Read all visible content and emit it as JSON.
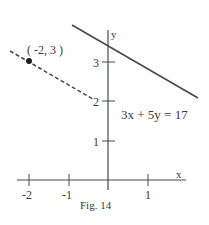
{
  "figure": {
    "caption": "Fig. 14",
    "colors": {
      "line": "#4a4a4a",
      "text": "#3a3a3a",
      "background": "#ffffff"
    }
  },
  "axes": {
    "x_label": "x",
    "y_label": "y",
    "x_ticks": [
      {
        "value": -2,
        "label": "-2"
      },
      {
        "value": -1,
        "label": "-1"
      },
      {
        "value": 1,
        "label": "1"
      }
    ],
    "y_ticks": [
      {
        "value": 1,
        "label": "1"
      },
      {
        "value": 2,
        "label": "2"
      },
      {
        "value": 3,
        "label": "3"
      }
    ]
  },
  "lines": {
    "solid": {
      "equation": "3x + 5y = 17",
      "style": "solid"
    },
    "dashed": {
      "style": "dashed",
      "point_label": "( -2, 3 )",
      "point": {
        "x": -2,
        "y": 3
      }
    }
  }
}
